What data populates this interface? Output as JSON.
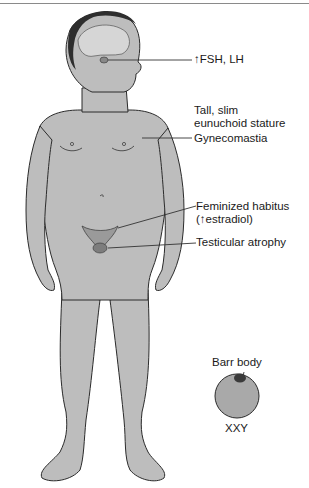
{
  "figure": {
    "labels": {
      "hormones": "↑FSH, LH",
      "stature_line1": "Tall, slim",
      "stature_line2": "eunuchoid stature",
      "gynecomastia": "Gynecomastia",
      "habitus_line1": "Feminized habitus",
      "habitus_line2": "(↑estradiol)",
      "testes": "Testicular atrophy",
      "barr_body": "Barr body",
      "karyotype": "XXY"
    },
    "colors": {
      "skin": "#bdbdbd",
      "outline": "#2b2b2b",
      "hair": "#2e2e2e",
      "brain": "#d6d6d6",
      "cell": "#a9a9a9",
      "barr": "#3a3a3a",
      "leader": "#333333"
    }
  }
}
